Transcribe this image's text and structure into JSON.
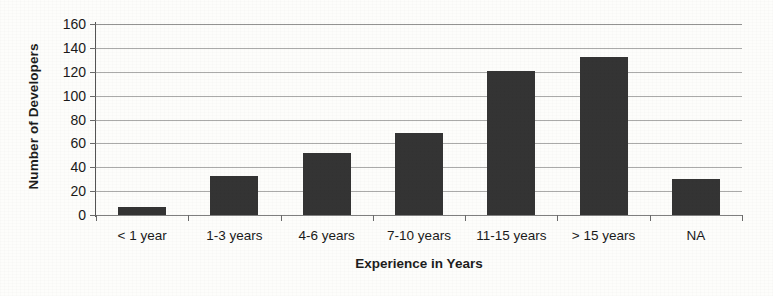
{
  "chart_data": {
    "type": "bar",
    "title": "",
    "subtitle": "",
    "xlabel": "Experience in Years",
    "ylabel": "Number of Developers",
    "categories": [
      "< 1 year",
      "1-3 years",
      "4-6 years",
      "7-10 years",
      "11-15 years",
      "> 15 years",
      "NA"
    ],
    "values": [
      7,
      33,
      52,
      69,
      121,
      132,
      30
    ],
    "series": [
      {
        "name": "Number of Developers",
        "values": [
          7,
          33,
          52,
          69,
          121,
          132,
          30
        ]
      }
    ],
    "ylim": [
      0,
      160
    ],
    "ytick_step": 20,
    "yticks": [
      160,
      140,
      120,
      100,
      80,
      60,
      40,
      20,
      0
    ],
    "ytick_labels": [
      "160",
      "140",
      "120",
      "100",
      "80",
      "60",
      "40",
      "20",
      "0"
    ],
    "grid": true,
    "grid_axis": "y",
    "legend": false,
    "legend_position": "none",
    "annotations": [],
    "bar_color": "#343434",
    "gridline_color": "#8e8e8e",
    "axis_color": "#555555",
    "background_color": "#fdfdfb",
    "text_color": "#1a1a1a"
  }
}
